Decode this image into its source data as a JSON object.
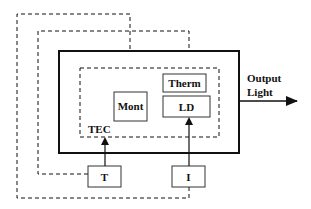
{
  "diagram": {
    "type": "block-diagram",
    "blocks": {
      "therm": "Therm",
      "ld": "LD",
      "mont": "Mont",
      "t": "T",
      "i": "I"
    },
    "labels": {
      "tec": "TEC",
      "output_line1": "Output",
      "output_line2": "Light"
    },
    "colors": {
      "line": "#111111",
      "background": "#ffffff"
    }
  }
}
